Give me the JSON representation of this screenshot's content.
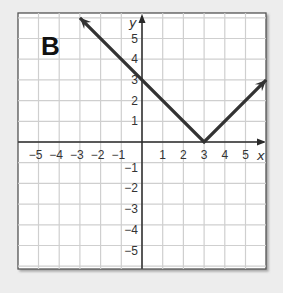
{
  "panel_label": "B",
  "chart_data": {
    "type": "line",
    "title": "",
    "panel_label": "B",
    "xlabel": "x",
    "ylabel": "y",
    "xlim": [
      -6,
      6
    ],
    "ylim": [
      -6,
      6
    ],
    "grid": true,
    "x_ticks": [
      -5,
      -4,
      -3,
      -2,
      -1,
      1,
      2,
      3,
      4,
      5
    ],
    "y_ticks": [
      -5,
      -4,
      -3,
      -2,
      -1,
      1,
      2,
      3,
      4,
      5
    ],
    "x_tick_labels": [
      "−5",
      "−4",
      "−3",
      "−2",
      "−1",
      "1",
      "2",
      "3",
      "4",
      "5"
    ],
    "y_tick_labels": [
      "−5",
      "−4",
      "−3",
      "−2",
      "−1",
      "1",
      "2",
      "3",
      "4",
      "5"
    ],
    "series": [
      {
        "name": "absolute value graph",
        "equation": "y = |x - 3|",
        "points": [
          [
            -3,
            6
          ],
          [
            3,
            0
          ],
          [
            6,
            3
          ]
        ],
        "vertex": [
          3,
          0
        ],
        "y_intercept": 3,
        "arrows_both_ends": true
      }
    ]
  },
  "colors": {
    "background": "#ededed",
    "plot_bg": "#ffffff",
    "grid": "#cfcfcf",
    "axis": "#2a2a2a",
    "line": "#333333",
    "frame": "#555555"
  }
}
